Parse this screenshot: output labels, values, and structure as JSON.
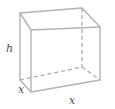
{
  "figure": {
    "kind": "geometry-diagram",
    "shape": "rectangular-box",
    "projection": "oblique",
    "background_color": "#ffffff",
    "line_color": "#b3b3b3",
    "hidden_line_color": "#b0b0b0",
    "label_color": "#4d4d4d",
    "labels": {
      "height": "h",
      "width": "x",
      "depth": "x"
    },
    "vertices": {
      "front_top_left": [
        31,
        30
      ],
      "front_top_right": [
        100,
        27
      ],
      "front_bottom_left": [
        31,
        92
      ],
      "front_bottom_right": [
        100,
        80
      ],
      "back_top_left": [
        20,
        13
      ],
      "back_top_right": [
        82,
        8
      ],
      "back_bottom_left": [
        20,
        80
      ],
      "back_bottom_right": [
        82,
        67
      ]
    },
    "edges": [
      {
        "name": "front-top",
        "from": "front_top_left",
        "to": "front_top_right",
        "style": "solid"
      },
      {
        "name": "front-left",
        "from": "front_top_left",
        "to": "front_bottom_left",
        "style": "solid"
      },
      {
        "name": "front-right",
        "from": "front_top_right",
        "to": "front_bottom_right",
        "style": "solid"
      },
      {
        "name": "front-bottom",
        "from": "front_bottom_left",
        "to": "front_bottom_right",
        "style": "solid"
      },
      {
        "name": "back-top",
        "from": "back_top_left",
        "to": "back_top_right",
        "style": "solid"
      },
      {
        "name": "back-left",
        "from": "back_top_left",
        "to": "back_bottom_left",
        "style": "solid"
      },
      {
        "name": "top-left-connector",
        "from": "back_top_left",
        "to": "front_top_left",
        "style": "solid"
      },
      {
        "name": "top-right-connector",
        "from": "back_top_right",
        "to": "front_top_right",
        "style": "solid"
      },
      {
        "name": "bottom-left-connector",
        "from": "back_bottom_left",
        "to": "front_bottom_left",
        "style": "solid"
      },
      {
        "name": "back-right-vertical",
        "from": "back_top_right",
        "to": "back_bottom_right",
        "style": "dashed"
      },
      {
        "name": "back-bottom",
        "from": "back_bottom_left",
        "to": "back_bottom_right",
        "style": "dashed"
      },
      {
        "name": "bottom-right-connector",
        "from": "back_bottom_right",
        "to": "front_bottom_right",
        "style": "dashed"
      }
    ]
  }
}
